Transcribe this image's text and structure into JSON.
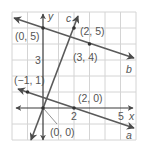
{
  "diagram": {
    "type": "coordinate-grid",
    "grid": {
      "x_range": [
        -2,
        6
      ],
      "y_range": [
        -2,
        6
      ],
      "grid_color": "#d4d4d4",
      "line_color": "#5a5a5a"
    },
    "axes": {
      "x_label": "x",
      "y_label": "y",
      "x_ticks": [
        "2",
        "5"
      ],
      "y_ticks": [
        "3"
      ]
    },
    "lines": [
      {
        "name": "a",
        "label": "a",
        "through": [
          [
            -1,
            1
          ],
          [
            2,
            0
          ]
        ]
      },
      {
        "name": "b",
        "label": "b",
        "through": [
          [
            0,
            5
          ],
          [
            3,
            4
          ]
        ]
      },
      {
        "name": "c",
        "label": "c",
        "through": [
          [
            0,
            0
          ],
          [
            2,
            5
          ]
        ]
      }
    ],
    "points": [
      {
        "label": "(0, 5)"
      },
      {
        "label": "(2, 5)"
      },
      {
        "label": "(3, 4)"
      },
      {
        "label": "(−1, 1)"
      },
      {
        "label": "(2, 0)"
      },
      {
        "label": "(0, 0)"
      }
    ]
  }
}
